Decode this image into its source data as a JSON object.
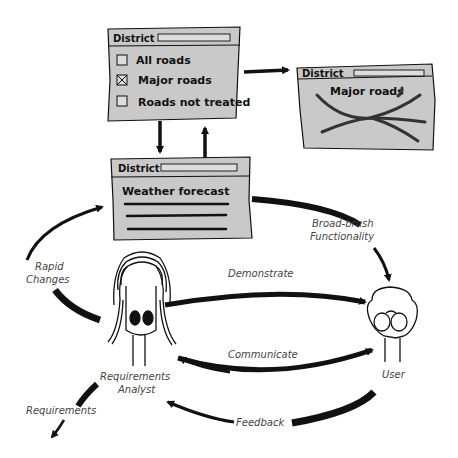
{
  "colors": {
    "window_fill": "#c9c9c9",
    "ink": "#111111",
    "label_text": "#444444",
    "background": "#ffffff"
  },
  "windows": {
    "filter_window": {
      "title": "District",
      "options": [
        {
          "label": "All roads",
          "checked": false
        },
        {
          "label": "Major roads",
          "checked": true
        },
        {
          "label": "Roads not treated",
          "checked": false
        }
      ]
    },
    "map_window": {
      "title": "District",
      "heading": "Major roads"
    },
    "forecast_window": {
      "title": "District",
      "heading": "Weather forecast"
    }
  },
  "actors": {
    "analyst": {
      "label_line1": "Requirements",
      "label_line2": "Analyst"
    },
    "user": {
      "label": "User"
    }
  },
  "flows": {
    "broad_brush_line1": "Broad-brush",
    "broad_brush_line2": "Functionality",
    "demonstrate": "Demonstrate",
    "rapid_line1": "Rapid",
    "rapid_line2": "Changes",
    "communicate": "Communicate",
    "feedback": "Feedback",
    "requirements": "Requirements"
  }
}
